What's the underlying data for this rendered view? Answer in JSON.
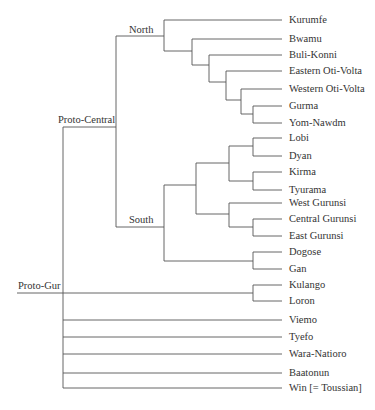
{
  "diagram": {
    "type": "tree",
    "root": "Proto-Gur",
    "line_color": "#555555",
    "text_color": "#333333",
    "internal_labels": {
      "proto_gur": "Proto-Gur",
      "proto_central": "Proto-Central",
      "north": "North",
      "south": "South"
    },
    "leaves": [
      {
        "name": "Kurumfe",
        "y": 20
      },
      {
        "name": "Bwamu",
        "y": 39
      },
      {
        "name": "Buli-Konni",
        "y": 55
      },
      {
        "name": "Eastern Oti-Volta",
        "y": 71
      },
      {
        "name": "Western Oti-Volta",
        "y": 89
      },
      {
        "name": "Gurma",
        "y": 106
      },
      {
        "name": "Yom-Nawdm",
        "y": 123
      },
      {
        "name": "Lobi",
        "y": 138
      },
      {
        "name": "Dyan",
        "y": 156
      },
      {
        "name": "Kirma",
        "y": 172
      },
      {
        "name": "Tyurama",
        "y": 190
      },
      {
        "name": "West Gurunsi",
        "y": 203
      },
      {
        "name": "Central Gurunsi",
        "y": 219
      },
      {
        "name": "East Gurunsi",
        "y": 236
      },
      {
        "name": "Dogose",
        "y": 252
      },
      {
        "name": "Gan",
        "y": 269
      },
      {
        "name": "Kulango",
        "y": 285
      },
      {
        "name": "Loron",
        "y": 301
      },
      {
        "name": "Viemo",
        "y": 320
      },
      {
        "name": "Tyefo",
        "y": 337
      },
      {
        "name": "Wara-Natioro",
        "y": 354
      },
      {
        "name": "Baatonun",
        "y": 373
      },
      {
        "name": "Win [= Toussian]",
        "y": 388
      }
    ],
    "structure": "(((Kurumfe,(Bwamu,(Buli-Konni,(Eastern Oti-Volta,(Western Oti-Volta,(Gurma,Yom-Nawdm))))))North,((((Lobi,Dyan),(Kirma,Tyurama)),(West Gurunsi,(Central Gurunsi,East Gurunsi))),(Dogose,Gan))South)Proto-Central,(Kulango,Loron),Viemo,Tyefo,Wara-Natioro,Baatonun,Win [= Toussian])Proto-Gur"
  }
}
